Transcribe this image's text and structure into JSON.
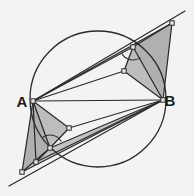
{
  "figure": {
    "background_color": "#f4f3f1",
    "stroke_color": "#2b2b2b",
    "shade_color": "#9a9a9a",
    "node_fill": "#e8e8e6",
    "labels": [
      {
        "name": "A",
        "text": "A",
        "x": 22,
        "y": 107
      },
      {
        "name": "B",
        "text": "B",
        "x": 170,
        "y": 106
      }
    ],
    "circle": {
      "cx": 98,
      "cy": 99,
      "r": 68,
      "stroke": "#2b2b2b",
      "stroke_width": 1.3,
      "fill": "none"
    },
    "points": {
      "A": {
        "x": 33,
        "y": 101
      },
      "B": {
        "x": 163,
        "y": 100
      },
      "P1": {
        "x": 172,
        "y": 23
      },
      "P2": {
        "x": 185,
        "y": 11
      },
      "P3": {
        "x": 133,
        "y": 47
      },
      "P4": {
        "x": 124,
        "y": 71
      },
      "Q1": {
        "x": 22,
        "y": 172
      },
      "Q2": {
        "x": 9,
        "y": 186
      },
      "Q3": {
        "x": 50,
        "y": 148
      },
      "Q4": {
        "x": 69,
        "y": 128
      },
      "Q5": {
        "x": 36,
        "y": 162
      }
    },
    "shaded_polygons": [
      {
        "name": "upper-outer-wedge",
        "points": "163,100 172,23 133,47",
        "opacity": 0.75
      },
      {
        "name": "upper-inner-wedge",
        "points": "163,100 133,47 124,71",
        "opacity": 0.6
      },
      {
        "name": "upper-sliver-a",
        "points": "33,101 172,23 133,47",
        "opacity": 0.55
      },
      {
        "name": "lower-outer-wedge",
        "points": "33,101 22,172 50,148",
        "opacity": 0.75
      },
      {
        "name": "lower-inner-wedge",
        "points": "33,101 50,148 69,128",
        "opacity": 0.6
      },
      {
        "name": "lower-sliver-a",
        "points": "163,100 22,172 50,148",
        "opacity": 0.55
      }
    ],
    "segments": [
      {
        "name": "chord-ab",
        "from": "A",
        "to": "B"
      },
      {
        "name": "ray-a-to-p2",
        "from": "A",
        "to": "P2"
      },
      {
        "name": "ray-a-to-p1",
        "from": "A",
        "to": "P1"
      },
      {
        "name": "ray-a-to-p3",
        "from": "A",
        "to": "P3"
      },
      {
        "name": "ray-a-to-p4",
        "from": "A",
        "to": "P4"
      },
      {
        "name": "ray-b-to-p1",
        "from": "B",
        "to": "P1"
      },
      {
        "name": "ray-b-to-p3",
        "from": "B",
        "to": "P3"
      },
      {
        "name": "ray-b-to-p4",
        "from": "B",
        "to": "P4"
      },
      {
        "name": "edge-p1-p3",
        "from": "P1",
        "to": "P3"
      },
      {
        "name": "edge-p3-p4",
        "from": "P3",
        "to": "P4"
      },
      {
        "name": "ray-b-to-q2",
        "from": "B",
        "to": "Q2"
      },
      {
        "name": "ray-b-to-q1",
        "from": "B",
        "to": "Q1"
      },
      {
        "name": "ray-b-to-q3",
        "from": "B",
        "to": "Q3"
      },
      {
        "name": "ray-b-to-q4",
        "from": "B",
        "to": "Q4"
      },
      {
        "name": "ray-a-to-q1",
        "from": "A",
        "to": "Q1"
      },
      {
        "name": "ray-a-to-q3",
        "from": "A",
        "to": "Q3"
      },
      {
        "name": "ray-a-to-q4",
        "from": "A",
        "to": "Q4"
      },
      {
        "name": "edge-q1-q3",
        "from": "Q1",
        "to": "Q3"
      },
      {
        "name": "edge-q3-q4",
        "from": "Q3",
        "to": "Q4"
      },
      {
        "name": "edge-q5-q3",
        "from": "Q5",
        "to": "Q3"
      },
      {
        "name": "edge-a-q5",
        "from": "A",
        "to": "Q5"
      },
      {
        "name": "edge-b-q5",
        "from": "B",
        "to": "Q5"
      }
    ],
    "vertex_nodes": [
      {
        "name": "node-a",
        "x": 33,
        "y": 101
      },
      {
        "name": "node-b",
        "x": 163,
        "y": 100
      },
      {
        "name": "node-p1",
        "x": 172,
        "y": 23
      },
      {
        "name": "node-p3",
        "x": 133,
        "y": 47
      },
      {
        "name": "node-p4",
        "x": 124,
        "y": 71
      },
      {
        "name": "node-q1",
        "x": 22,
        "y": 172
      },
      {
        "name": "node-q3",
        "x": 50,
        "y": 148
      },
      {
        "name": "node-q4",
        "x": 69,
        "y": 128
      },
      {
        "name": "node-q5",
        "x": 36,
        "y": 162
      }
    ],
    "angle_markers": [
      {
        "name": "angle-arc-upper",
        "cx": 133,
        "cy": 47,
        "r": 13,
        "start": 55,
        "end": 150
      },
      {
        "name": "angle-arc-lower",
        "cx": 50,
        "cy": 148,
        "r": 13,
        "start": 235,
        "end": 330
      }
    ]
  }
}
